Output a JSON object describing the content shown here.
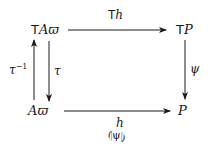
{
  "diagram": {
    "type": "commutative-square",
    "nodes": {
      "top_left": {
        "prefix": "T",
        "main": "A",
        "sub": "ϖ"
      },
      "top_right": {
        "prefix": "T",
        "main": "P"
      },
      "bottom_left": {
        "main": "A",
        "sub": "ϖ"
      },
      "bottom_right": {
        "main": "P"
      }
    },
    "arrows": {
      "top": {
        "prefix": "T",
        "label": "h",
        "from": "TAϖ",
        "to": "TP"
      },
      "right": {
        "label": "ψ",
        "from": "TP",
        "to": "P"
      },
      "bottom": {
        "label": "h",
        "sublabel": "⦇ψ⦈",
        "from": "Aϖ",
        "to": "P"
      },
      "left_up": {
        "label": "τ",
        "exponent": "−1",
        "from": "Aϖ",
        "to": "TAϖ"
      },
      "left_down": {
        "label": "τ",
        "from": "TAϖ",
        "to": "Aϖ"
      }
    },
    "colors": {
      "ink": "#1a1a1a",
      "background": "#ffffff"
    }
  }
}
